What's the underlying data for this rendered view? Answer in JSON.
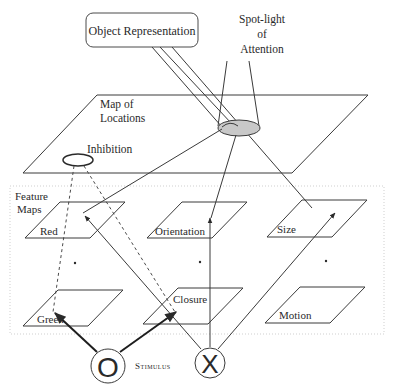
{
  "object_representation": {
    "label": "Object Representation"
  },
  "spotlight": {
    "line1": "Spot-light",
    "line2": "of",
    "line3": "Attention",
    "fill": "#c8c8c8"
  },
  "map_of_locations": {
    "line1": "Map of",
    "line2": "Locations"
  },
  "inhibition": {
    "label": "Inhibition"
  },
  "feature_maps": {
    "title_line1": "Feature",
    "title_line2": "Maps",
    "maps": [
      {
        "label": "Red"
      },
      {
        "label": "Orientation"
      },
      {
        "label": "Size"
      },
      {
        "label": "Green"
      },
      {
        "label": "Closure"
      },
      {
        "label": "Motion"
      }
    ],
    "ellipsis": "."
  },
  "stimulus": {
    "label": "Stimulus",
    "items": [
      {
        "glyph": "O"
      },
      {
        "glyph": "X"
      }
    ]
  }
}
